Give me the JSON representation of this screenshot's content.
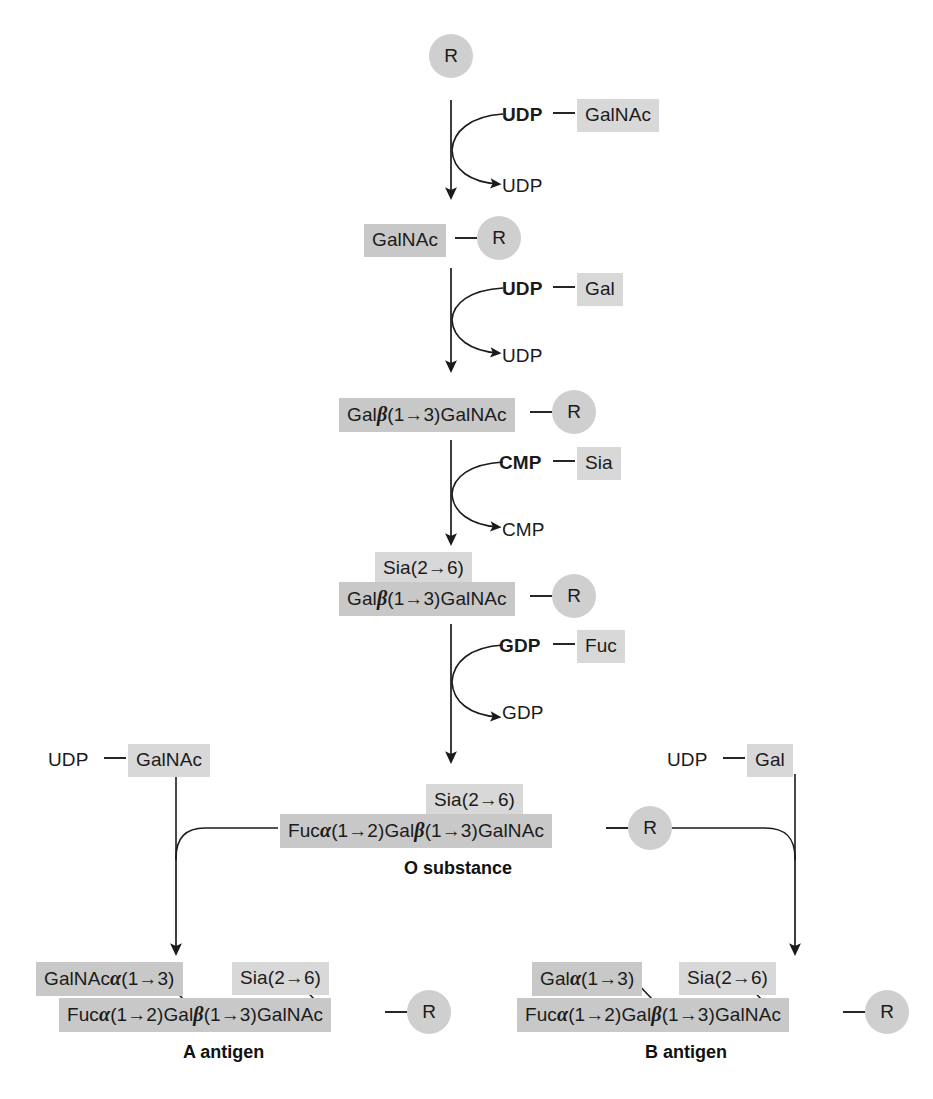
{
  "figure": {
    "colors": {
      "sugar_box_dark": "#c8c8c8",
      "sugar_box_light": "#d8d8d8",
      "r_circle": "#cfcfcf",
      "line": "#1b1b1b",
      "text": "#1b1b1b"
    }
  },
  "nodes": {
    "r_label": "R",
    "step0": {
      "core": "R"
    },
    "step1": {
      "donor_nucleotide": "UDP",
      "donor_sugar": "GalNAc",
      "released": "UDP",
      "product_sugar": "GalNAc",
      "product_core": "R"
    },
    "step2": {
      "donor_nucleotide": "UDP",
      "donor_sugar": "Gal",
      "released": "UDP",
      "product_chain_a": "Gal",
      "product_chain_b": "(1",
      "product_chain_full": "Galβ(1→3)GalNAc",
      "product_core": "R"
    },
    "step3": {
      "donor_nucleotide": "CMP",
      "donor_sugar": "Sia",
      "released": "CMP",
      "branch_sugar": "Sia(2→6)",
      "product_chain_full": "Galβ(1→3)GalNAc",
      "product_core": "R"
    },
    "step4": {
      "donor_nucleotide": "GDP",
      "donor_sugar": "Fuc",
      "released": "GDP",
      "branch_sugar": "Sia(2→6)",
      "product_chain_full": "Fucα(1→2)Galβ(1→3)GalNAc",
      "product_core": "R",
      "caption": "O substance"
    },
    "branch_left": {
      "donor_nucleotide": "UDP",
      "donor_sugar": "GalNAc",
      "added_sugar": "GalNAcα(1→3)",
      "branch_sugar": "Sia(2→6)",
      "product_chain_full": "Fucα(1→2)Galβ(1→3)GalNAc",
      "product_core": "R",
      "caption": "A antigen"
    },
    "branch_right": {
      "donor_nucleotide": "UDP",
      "donor_sugar": "Gal",
      "added_sugar": "Galα(1→3)",
      "branch_sugar": "Sia(2→6)",
      "product_chain_full": "Fucα(1→2)Galβ(1→3)GalNAc",
      "product_core": "R",
      "caption": "B antigen"
    }
  },
  "chain_parts": {
    "gal": "Gal",
    "beta": "β",
    "alpha": "α",
    "one_to_three": "(1→3)",
    "one_to_two": "(1→2)",
    "galnac": "GalNAc",
    "fuc": "Fuc",
    "sia_2_6": "Sia(2→6)"
  }
}
